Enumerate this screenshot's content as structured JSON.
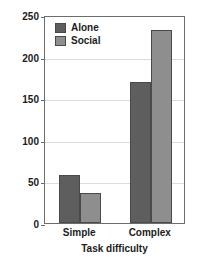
{
  "chart_data": {
    "type": "bar",
    "title": "",
    "xlabel": "Task difficulty",
    "ylabel": "Running time",
    "categories": [
      "Simple",
      "Complex"
    ],
    "series": [
      {
        "name": "Alone",
        "values": [
          58,
          170
        ],
        "color": "#5e5e5e"
      },
      {
        "name": "Social",
        "values": [
          36,
          232
        ],
        "color": "#8e8e8e"
      }
    ],
    "ylim": [
      0,
      250
    ],
    "yticks": [
      0,
      50,
      100,
      150,
      200,
      250
    ],
    "ytick_labels": [
      "0",
      "50",
      "100",
      "150",
      "200",
      "250"
    ],
    "grid": true,
    "legend_position": "top-left"
  },
  "legend": {
    "items": [
      {
        "label": "Alone"
      },
      {
        "label": "Social"
      }
    ]
  },
  "bleed_text": {
    "line1": " ",
    "line2": " "
  }
}
